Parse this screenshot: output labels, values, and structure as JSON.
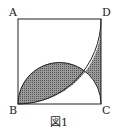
{
  "figure": {
    "caption": "図1",
    "vertices": {
      "A": "A",
      "B": "B",
      "C": "C",
      "D": "D"
    },
    "colors": {
      "line": "#222222",
      "hatch": "#555555",
      "background": "#ffffff"
    }
  }
}
